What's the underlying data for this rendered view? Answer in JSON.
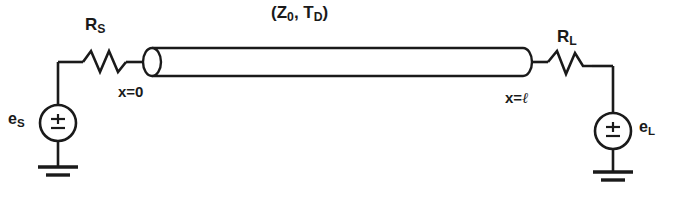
{
  "diagram": {
    "title_label": "transmission-line-circuit",
    "stroke_color": "#1a1a1a",
    "background_color": "#ffffff",
    "labels": {
      "line_params_open": "(",
      "line_params_z": "Z",
      "line_params_z_sub": "0",
      "line_params_sep": ",  ",
      "line_params_t": "T",
      "line_params_t_sub": "D",
      "line_params_close": ")",
      "rs_main": "R",
      "rs_sub": "S",
      "rl_main": "R",
      "rl_sub": "L",
      "x_origin": "x=0",
      "x_end_prefix": "x=",
      "x_end_ell": "ℓ",
      "es_main": "e",
      "es_sub": "S",
      "el_main": "e",
      "el_sub": "L",
      "source_symbol": "±"
    },
    "components": [
      {
        "name": "source-voltage-source",
        "type": "voltage-source",
        "label": "eS",
        "symbol": "±"
      },
      {
        "name": "source-resistor",
        "type": "resistor",
        "label": "RS"
      },
      {
        "name": "transmission-line",
        "type": "transmission-line",
        "label": "(Z0, TD)"
      },
      {
        "name": "load-resistor",
        "type": "resistor",
        "label": "RL"
      },
      {
        "name": "load-voltage-source",
        "type": "voltage-source",
        "label": "eL",
        "symbol": "±"
      },
      {
        "name": "source-ground",
        "type": "ground"
      },
      {
        "name": "load-ground",
        "type": "ground"
      }
    ],
    "nodes": [
      {
        "name": "line-input-node",
        "label": "x=0"
      },
      {
        "name": "line-output-node",
        "label": "x=ℓ"
      }
    ]
  }
}
